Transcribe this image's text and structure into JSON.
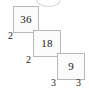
{
  "diagram": {
    "type": "factor-tree-staircase",
    "title": "",
    "nodes": [
      {
        "id": "n36",
        "value": "36"
      },
      {
        "id": "n18",
        "value": "18"
      },
      {
        "id": "n9",
        "value": "9"
      }
    ],
    "factors": [
      {
        "id": "f2a",
        "value": "2",
        "position": "left-of-36"
      },
      {
        "id": "f2b",
        "value": "2",
        "position": "left-of-18"
      },
      {
        "id": "f3a",
        "value": "3",
        "position": "below-left-of-9"
      },
      {
        "id": "f3b",
        "value": "3",
        "position": "below-right-of-9"
      }
    ],
    "colors": {
      "box_fill": "#fbfbfb",
      "box_border": "#b8b8b8",
      "text": "#1a1a1a",
      "rule": "#b8b8b8",
      "arc": "#d6d6d6",
      "background": "#ffffff"
    }
  }
}
